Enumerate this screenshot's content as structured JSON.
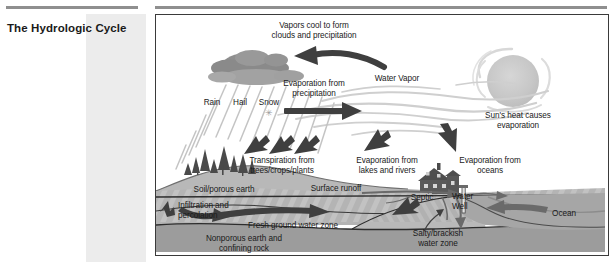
{
  "page": {
    "title": "The Hydrologic Cycle"
  },
  "diagram": {
    "name": "hydrologic-cycle-diagram",
    "colors": {
      "cloud": "#8a8a8a",
      "cloud_light": "#a8a8a8",
      "sun": "#c9c9c9",
      "arrow_dark": "#3f3f3f",
      "ground_aquifer": "#b4b4b4",
      "ground_rock": "#9c9c9c",
      "ocean": "#a6a6a6",
      "hill": "#b8b8b8",
      "house": "#555555",
      "frame_border": "#3a3a3a",
      "text": "#1a1a1a",
      "rule": "#8f8f8f",
      "side_band": "#ececec"
    },
    "labels": {
      "vapors_cool": "Vapors cool to form\nclouds and precipitation",
      "evaporation_precipitation": "Evaporation from\nprecipitation",
      "water_vapor": "Water Vapor",
      "suns_heat": "Sun's heat causes\nevaporation",
      "rain": "Rain",
      "hail": "Hail",
      "snow": "Snow",
      "snowflake_glyph": "✳",
      "transpiration": "Transpiration from\ntrees/crops/plants",
      "evaporation_lakes": "Evaporation from\nlakes and rivers",
      "evaporation_oceans": "Evaporation from\noceans",
      "soil_porous_earth": "Soil/porous earth",
      "surface_runoff": "Surface runoff",
      "infiltration": "Infiltration and\npercolation",
      "fresh_ground_water": "Fresh ground water zone",
      "nonporous_earth": "Nonporous earth and\nconfining rock",
      "septic": "Septic",
      "water_well": "Water\nWell",
      "salty_brackish": "Salty/brackish\nwater zone",
      "ocean": "Ocean"
    }
  }
}
